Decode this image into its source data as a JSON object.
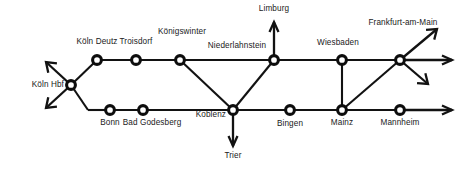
{
  "diagram": {
    "background_color": "#ffffff",
    "line_color": "#121212",
    "node_fill": "#ffffff",
    "node_stroke": "#0d0d0d"
  },
  "stations": [
    {
      "id": "koeln-hbf",
      "label": "Köln Hbf",
      "x": 71,
      "y": 85,
      "label_x": 64,
      "label_y": 81,
      "align": "right"
    },
    {
      "id": "koeln-deutz",
      "label": "Köln Deutz",
      "x": 97,
      "y": 60,
      "label_x": 97,
      "label_y": 38,
      "align": "center"
    },
    {
      "id": "troisdorf",
      "label": "Troisdorf",
      "x": 136,
      "y": 60,
      "label_x": 136,
      "label_y": 38,
      "align": "center"
    },
    {
      "id": "koenigswinter",
      "label": "Königswinter",
      "x": 180,
      "y": 60,
      "label_x": 182,
      "label_y": 28,
      "align": "center"
    },
    {
      "id": "niederlahnstein",
      "label": "Niederlahnstein",
      "x": 274,
      "y": 60,
      "label_x": 237,
      "label_y": 42,
      "align": "center"
    },
    {
      "id": "wiesbaden",
      "label": "Wiesbaden",
      "x": 342,
      "y": 60,
      "label_x": 338,
      "label_y": 39,
      "align": "center"
    },
    {
      "id": "frankfurt",
      "label": "Frankfurt-am-Main",
      "x": 400,
      "y": 60,
      "label_x": 403,
      "label_y": 19,
      "align": "center"
    },
    {
      "id": "bonn",
      "label": "Bonn",
      "x": 110,
      "y": 110,
      "label_x": 110,
      "label_y": 119,
      "align": "center"
    },
    {
      "id": "bad-godesberg",
      "label": "Bad Godesberg",
      "x": 143,
      "y": 110,
      "label_x": 152,
      "label_y": 119,
      "align": "center"
    },
    {
      "id": "koblenz",
      "label": "Koblenz",
      "x": 233,
      "y": 110,
      "label_x": 226,
      "label_y": 111,
      "align": "right"
    },
    {
      "id": "bingen",
      "label": "Bingen",
      "x": 290,
      "y": 110,
      "label_x": 290,
      "label_y": 120,
      "align": "center"
    },
    {
      "id": "mainz",
      "label": "Mainz",
      "x": 342,
      "y": 110,
      "label_x": 342,
      "label_y": 119,
      "align": "center"
    },
    {
      "id": "mannheim",
      "label": "Mannheim",
      "x": 400,
      "y": 110,
      "label_x": 400,
      "label_y": 119,
      "align": "center"
    }
  ],
  "terminals": [
    {
      "id": "limburg",
      "label": "Limburg",
      "label_x": 274,
      "label_y": 5,
      "align": "center"
    },
    {
      "id": "trier",
      "label": "Trier",
      "label_x": 233,
      "label_y": 152,
      "align": "center"
    }
  ],
  "edges": [
    {
      "id": "koeln-hbf--koeln-deutz",
      "x1": 71,
      "y1": 85,
      "x2": 97,
      "y2": 60
    },
    {
      "id": "koeln-deutz--troisdorf",
      "x1": 97,
      "y1": 60,
      "x2": 136,
      "y2": 60
    },
    {
      "id": "troisdorf--koenigswinter",
      "x1": 136,
      "y1": 60,
      "x2": 180,
      "y2": 60
    },
    {
      "id": "koenigswinter--niederlahnstein",
      "x1": 180,
      "y1": 60,
      "x2": 274,
      "y2": 60
    },
    {
      "id": "koenigswinter--koblenz",
      "x1": 180,
      "y1": 60,
      "x2": 233,
      "y2": 110
    },
    {
      "id": "niederlahnstein--koblenz",
      "x1": 274,
      "y1": 60,
      "x2": 233,
      "y2": 110
    },
    {
      "id": "niederlahnstein--wiesbaden",
      "x1": 274,
      "y1": 60,
      "x2": 342,
      "y2": 60
    },
    {
      "id": "wiesbaden--frankfurt",
      "x1": 342,
      "y1": 60,
      "x2": 400,
      "y2": 60
    },
    {
      "id": "wiesbaden--mainz",
      "x1": 342,
      "y1": 60,
      "x2": 342,
      "y2": 110
    },
    {
      "id": "koeln-hbf--bonn",
      "x1": 71,
      "y1": 85,
      "x2": 88,
      "y2": 110
    },
    {
      "id": "bonn-approach",
      "x1": 88,
      "y1": 110,
      "x2": 110,
      "y2": 110
    },
    {
      "id": "bonn--bad-godesberg",
      "x1": 110,
      "y1": 110,
      "x2": 143,
      "y2": 110
    },
    {
      "id": "bad-godesberg--koblenz",
      "x1": 143,
      "y1": 110,
      "x2": 233,
      "y2": 110
    },
    {
      "id": "koblenz--bingen",
      "x1": 233,
      "y1": 110,
      "x2": 290,
      "y2": 110
    },
    {
      "id": "bingen--mainz",
      "x1": 290,
      "y1": 110,
      "x2": 342,
      "y2": 110
    },
    {
      "id": "mainz--mannheim",
      "x1": 342,
      "y1": 110,
      "x2": 400,
      "y2": 110
    },
    {
      "id": "mainz--frankfurt",
      "x1": 342,
      "y1": 110,
      "x2": 400,
      "y2": 60
    }
  ],
  "arrows": [
    {
      "id": "koeln-hbf-northwest",
      "x1": 71,
      "y1": 85,
      "x2": 46,
      "y2": 62,
      "head": "L"
    },
    {
      "id": "koeln-hbf-southwest",
      "x1": 71,
      "y1": 85,
      "x2": 46,
      "y2": 108,
      "head": "L"
    },
    {
      "id": "niederlahnstein-limburg",
      "x1": 274,
      "y1": 60,
      "x2": 274,
      "y2": 22,
      "head": "V"
    },
    {
      "id": "koblenz-trier",
      "x1": 233,
      "y1": 110,
      "x2": 233,
      "y2": 146,
      "head": "V"
    },
    {
      "id": "frankfurt-northeast",
      "x1": 400,
      "y1": 60,
      "x2": 437,
      "y2": 29,
      "head": "L"
    },
    {
      "id": "frankfurt-east",
      "x1": 400,
      "y1": 60,
      "x2": 452,
      "y2": 60,
      "head": "V"
    },
    {
      "id": "frankfurt-southeast",
      "x1": 400,
      "y1": 60,
      "x2": 428,
      "y2": 84,
      "head": "L"
    },
    {
      "id": "mannheim-east",
      "x1": 400,
      "y1": 110,
      "x2": 452,
      "y2": 110,
      "head": "V"
    }
  ]
}
